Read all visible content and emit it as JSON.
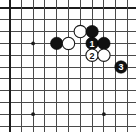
{
  "figure": {
    "kind": "go-board-diagram",
    "caption": "",
    "width_px": 136,
    "height_px": 139,
    "background_color": "#ffffff"
  },
  "board": {
    "label": "Go board diagram, upper-left quadrant",
    "grid_line_color": "#4a4a4a",
    "edge_line_color": "#1c1c1c",
    "origin_x": 9.5,
    "origin_y": 8,
    "spacing": 11.8,
    "cols": 11,
    "rows": 11,
    "top_edge": true,
    "left_edge": true,
    "star_points": [
      {
        "name": "hoshi-upper-left",
        "col": 2,
        "row": 3
      },
      {
        "name": "hoshi-lower-left",
        "col": 2,
        "row": 9
      },
      {
        "name": "hoshi-lower-center",
        "col": 8,
        "row": 9
      }
    ],
    "stones": [
      {
        "name": "black-stone-lone",
        "color": "black",
        "col": 4,
        "row": 3,
        "label": ""
      },
      {
        "name": "white-stone-upper",
        "color": "white",
        "col": 6,
        "row": 2,
        "label": ""
      },
      {
        "name": "black-stone-top",
        "color": "black",
        "col": 7,
        "row": 2,
        "label": ""
      },
      {
        "name": "white-stone-left",
        "color": "white",
        "col": 5,
        "row": 3,
        "label": ""
      },
      {
        "name": "black-stone-move-1",
        "color": "black",
        "col": 7,
        "row": 3,
        "label": "1"
      },
      {
        "name": "black-stone-right",
        "color": "black",
        "col": 8,
        "row": 3,
        "label": ""
      },
      {
        "name": "white-stone-move-2",
        "color": "white",
        "col": 7,
        "row": 4,
        "label": "2"
      },
      {
        "name": "white-stone-lower-right",
        "color": "white",
        "col": 8,
        "row": 4,
        "label": ""
      },
      {
        "name": "black-stone-move-3",
        "color": "black",
        "col": 9.45,
        "row": 5,
        "label": "3"
      }
    ],
    "move_labels": [
      "1",
      "2",
      "3"
    ],
    "stone_radius": 6.2
  }
}
